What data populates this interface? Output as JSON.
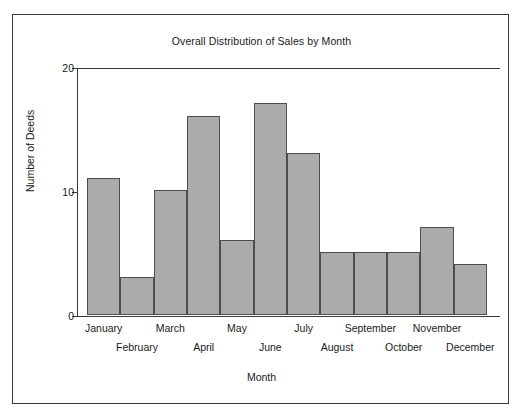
{
  "figure": {
    "border_color": "#3a3a3a",
    "background": "#ffffff"
  },
  "chart_data": {
    "type": "bar",
    "title": "Overall Distribution of Sales by Month",
    "xlabel": "Month",
    "ylabel": "Number of Deeds",
    "categories": [
      "January",
      "February",
      "March",
      "April",
      "May",
      "June",
      "July",
      "August",
      "September",
      "October",
      "November",
      "December"
    ],
    "values": [
      11,
      3,
      10,
      16,
      6,
      17,
      13,
      5,
      5,
      5,
      7,
      4
    ],
    "ylim": [
      0,
      20
    ],
    "yticks": [
      0,
      10,
      20
    ],
    "ytick_labels": [
      "0",
      "10",
      "20"
    ],
    "grid": false,
    "legend": null,
    "bar_fill_color": "#ababab",
    "bar_edge_color": "#4d4d4d",
    "bar_gap": 0,
    "xtick_label_rows": [
      0,
      1,
      0,
      1,
      0,
      1,
      0,
      1,
      0,
      1,
      0,
      1
    ]
  }
}
